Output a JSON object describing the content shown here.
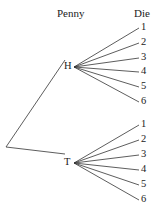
{
  "headers": {
    "penny": "Penny",
    "die": "Die"
  },
  "tree": {
    "root": {
      "x": 6,
      "y": 147
    },
    "nodes": [
      {
        "label": "H",
        "x": 74,
        "y": 67,
        "lx": 64,
        "ly": 61,
        "leaves": [
          {
            "label": "1",
            "y": 28
          },
          {
            "label": "2",
            "y": 43
          },
          {
            "label": "3",
            "y": 58
          },
          {
            "label": "4",
            "y": 72
          },
          {
            "label": "5",
            "y": 87
          },
          {
            "label": "6",
            "y": 102
          }
        ]
      },
      {
        "label": "T",
        "x": 74,
        "y": 163,
        "lx": 64,
        "ly": 157,
        "leaves": [
          {
            "label": "1",
            "y": 125
          },
          {
            "label": "2",
            "y": 140
          },
          {
            "label": "3",
            "y": 155
          },
          {
            "label": "4",
            "y": 170
          },
          {
            "label": "5",
            "y": 185
          },
          {
            "label": "6",
            "y": 200
          }
        ]
      }
    ],
    "leaf_x": 139,
    "leaf_label_x": 141,
    "line_color": "#333333"
  }
}
